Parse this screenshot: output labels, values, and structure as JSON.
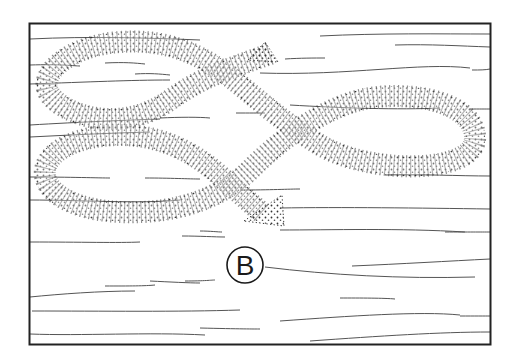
{
  "figure": {
    "type": "technique-illustration",
    "label": "B",
    "colors": {
      "background": "#ffffff",
      "frame": "#222222",
      "grain": "#444444",
      "stipple": "#333333"
    }
  }
}
